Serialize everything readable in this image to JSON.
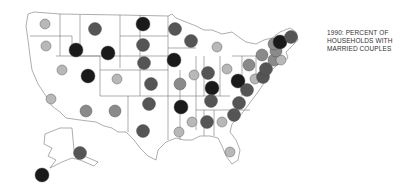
{
  "title_lines": [
    "1990: PERCENT OF",
    "HOUSEHOLDS WITH",
    "MARRIED COUPLES"
  ],
  "legend_classes": {
    "light": {
      "color": "#b8b8b8",
      "r": 5
    },
    "medium": {
      "color": "#8a8a8a",
      "r": 6
    },
    "dark": {
      "color": "#555555",
      "r": 6.5
    },
    "black": {
      "color": "#1a1a1a",
      "r": 7
    }
  },
  "states": [
    {
      "id": "WA",
      "x": 45,
      "y": 24,
      "cls": "light"
    },
    {
      "id": "OR",
      "x": 46,
      "y": 46,
      "cls": "light"
    },
    {
      "id": "ID",
      "x": 76,
      "y": 50,
      "cls": "black"
    },
    {
      "id": "MT",
      "x": 95,
      "y": 29,
      "cls": "dark"
    },
    {
      "id": "WY",
      "x": 108,
      "y": 53,
      "cls": "black"
    },
    {
      "id": "ND",
      "x": 143,
      "y": 24,
      "cls": "black"
    },
    {
      "id": "SD",
      "x": 143,
      "y": 45,
      "cls": "dark"
    },
    {
      "id": "NE",
      "x": 144,
      "y": 63,
      "cls": "dark"
    },
    {
      "id": "NV",
      "x": 62,
      "y": 70,
      "cls": "light"
    },
    {
      "id": "UT",
      "x": 88,
      "y": 76,
      "cls": "black"
    },
    {
      "id": "CO",
      "x": 117,
      "y": 79,
      "cls": "light"
    },
    {
      "id": "KS",
      "x": 151,
      "y": 84,
      "cls": "dark"
    },
    {
      "id": "CA",
      "x": 51,
      "y": 99,
      "cls": "light"
    },
    {
      "id": "AZ",
      "x": 86,
      "y": 111,
      "cls": "medium"
    },
    {
      "id": "NM",
      "x": 115,
      "y": 111,
      "cls": "medium"
    },
    {
      "id": "OK",
      "x": 149,
      "y": 104,
      "cls": "dark"
    },
    {
      "id": "TX",
      "x": 143,
      "y": 131,
      "cls": "dark"
    },
    {
      "id": "MN",
      "x": 175,
      "y": 29,
      "cls": "dark"
    },
    {
      "id": "WI",
      "x": 191,
      "y": 41,
      "cls": "dark"
    },
    {
      "id": "MI",
      "x": 217,
      "y": 47,
      "cls": "light"
    },
    {
      "id": "IA",
      "x": 174,
      "y": 60,
      "cls": "black"
    },
    {
      "id": "IL",
      "x": 194,
      "y": 75,
      "cls": "light"
    },
    {
      "id": "IN",
      "x": 208,
      "y": 73,
      "cls": "dark"
    },
    {
      "id": "OH",
      "x": 227,
      "y": 69,
      "cls": "light"
    },
    {
      "id": "MO",
      "x": 180,
      "y": 84,
      "cls": "medium"
    },
    {
      "id": "KY",
      "x": 212,
      "y": 88,
      "cls": "black"
    },
    {
      "id": "WV",
      "x": 238,
      "y": 81,
      "cls": "black"
    },
    {
      "id": "PA",
      "x": 249,
      "y": 65,
      "cls": "medium"
    },
    {
      "id": "NY",
      "x": 262,
      "y": 55,
      "cls": "medium"
    },
    {
      "id": "VA",
      "x": 247,
      "y": 90,
      "cls": "dark"
    },
    {
      "id": "MD",
      "x": 255,
      "y": 79,
      "cls": "light"
    },
    {
      "id": "DE",
      "x": 263,
      "y": 77,
      "cls": "dark"
    },
    {
      "id": "NJ",
      "x": 266,
      "y": 69,
      "cls": "dark"
    },
    {
      "id": "CT",
      "x": 274,
      "y": 60,
      "cls": "medium"
    },
    {
      "id": "RI",
      "x": 281,
      "y": 60,
      "cls": "light"
    },
    {
      "id": "MA",
      "x": 276,
      "y": 51,
      "cls": "medium"
    },
    {
      "id": "VT",
      "x": 274,
      "y": 44,
      "cls": "medium"
    },
    {
      "id": "NH",
      "x": 280,
      "y": 42,
      "cls": "black"
    },
    {
      "id": "ME",
      "x": 291,
      "y": 37,
      "cls": "dark"
    },
    {
      "id": "TN",
      "x": 211,
      "y": 101,
      "cls": "dark"
    },
    {
      "id": "NC",
      "x": 239,
      "y": 103,
      "cls": "dark"
    },
    {
      "id": "SC",
      "x": 234,
      "y": 115,
      "cls": "dark"
    },
    {
      "id": "AR",
      "x": 181,
      "y": 107,
      "cls": "black"
    },
    {
      "id": "MS",
      "x": 192,
      "y": 122,
      "cls": "light"
    },
    {
      "id": "AL",
      "x": 207,
      "y": 122,
      "cls": "dark"
    },
    {
      "id": "GA",
      "x": 222,
      "y": 122,
      "cls": "light"
    },
    {
      "id": "LA",
      "x": 179,
      "y": 132,
      "cls": "light"
    },
    {
      "id": "FL",
      "x": 230,
      "y": 152,
      "cls": "light"
    },
    {
      "id": "AK",
      "x": 80,
      "y": 153,
      "cls": "dark"
    },
    {
      "id": "HI",
      "x": 42,
      "y": 175,
      "cls": "black"
    }
  ]
}
